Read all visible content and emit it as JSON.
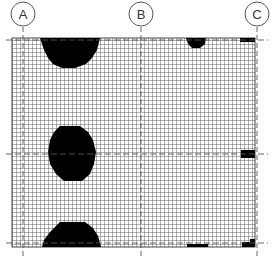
{
  "diagram": {
    "type": "structural grid plan with density map",
    "grid_axes": [
      {
        "label": "A",
        "x": 23
      },
      {
        "label": "B",
        "x": 141
      },
      {
        "label": "C",
        "x": 257
      }
    ],
    "horizontal_axes_y": [
      40,
      154,
      243
    ],
    "grid_area": {
      "x0": 12,
      "y0": 38,
      "x1": 255,
      "y1": 247,
      "cell": 4
    },
    "colors": {
      "grid": "#555555",
      "fill": "#000000",
      "background": "#ffffff",
      "axis": "#666666"
    },
    "blobs": [
      {
        "name": "top-left-blob",
        "points": "40,38 100,38 97,50 92,58 86,64 75,68 62,68 53,64 48,58 44,50"
      },
      {
        "name": "middle-left-blob",
        "points": "60,126 80,126 88,132 93,140 96,152 94,164 90,174 82,181 64,181 56,174 50,164 48,152 50,140 54,132"
      },
      {
        "name": "bottom-left-blob",
        "points": "60,222 85,222 93,228 98,236 101,247 42,247 44,240 50,232"
      },
      {
        "name": "top-mid-blob",
        "points": "186,38 206,38 205,44 200,48 192,48 188,44"
      },
      {
        "name": "top-right-edge",
        "points": "240,38 255,38 255,42 240,42"
      },
      {
        "name": "middle-right-edge",
        "points": "241,150 255,150 255,158 241,158"
      },
      {
        "name": "bottom-mid-edge",
        "points": "187,244 208,244 208,247 187,247"
      },
      {
        "name": "bottom-right-edge",
        "points": "242,242 250,242 250,239 255,239 255,247 242,247"
      }
    ]
  }
}
